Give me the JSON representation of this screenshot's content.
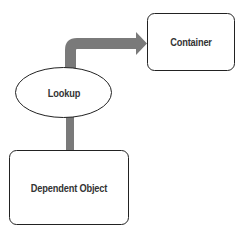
{
  "diagram": {
    "nodes": [
      {
        "id": "container",
        "label": "Container",
        "shape": "rounded-rect"
      },
      {
        "id": "lookup",
        "label": "Lookup",
        "shape": "ellipse"
      },
      {
        "id": "dependent",
        "label": "Dependent Object",
        "shape": "rounded-rect"
      }
    ],
    "edges": [
      {
        "from": "dependent",
        "to": "lookup",
        "style": "thick-line",
        "color": "#7a7a7a"
      },
      {
        "from": "lookup",
        "to": "container",
        "style": "thick-arrow",
        "color": "#7a7a7a"
      }
    ],
    "colors": {
      "stroke": "#222222",
      "connector": "#7a7a7a",
      "text": "#333333",
      "background": "#ffffff"
    }
  }
}
